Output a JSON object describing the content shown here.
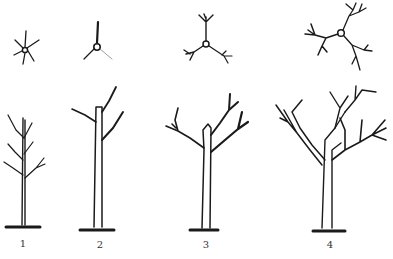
{
  "diagram": {
    "title": "",
    "stages": [
      {
        "label": "1",
        "plan_view": "six-branch-whorl",
        "side_view": "young-whip-with-laterals"
      },
      {
        "label": "2",
        "plan_view": "three-branch-leader",
        "side_view": "headed-trunk-with-two-scaffolds"
      },
      {
        "label": "3",
        "plan_view": "three-scaffold-branched",
        "side_view": "three-scaffold-tree"
      },
      {
        "label": "4",
        "plan_view": "three-scaffold-secondary-branched",
        "side_view": "mature-open-center-tree"
      }
    ],
    "colors": {
      "ink": "#1a1a1a",
      "background": "#ffffff"
    }
  }
}
